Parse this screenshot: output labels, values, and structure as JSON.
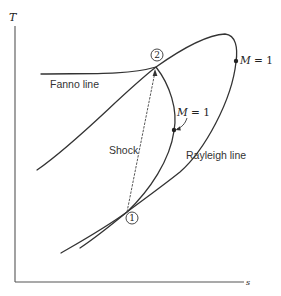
{
  "diagram": {
    "type": "T-s diagram",
    "axes": {
      "y_label": "T",
      "x_label": "s"
    },
    "curves": [
      {
        "name": "Fanno line",
        "label": "Fanno line"
      },
      {
        "name": "Rayleigh line",
        "label": "Rayleigh line"
      }
    ],
    "shock": {
      "label": "Shock",
      "style": "dashed",
      "from_state": "1",
      "to_state": "2"
    },
    "states": [
      {
        "id": "1",
        "label": "1"
      },
      {
        "id": "2",
        "label": "2"
      }
    ],
    "mach_points": [
      {
        "curve": "Rayleigh line",
        "label_M": "M",
        "label_rest": " = 1",
        "text": "M = 1"
      },
      {
        "curve": "Fanno line",
        "label_M": "M",
        "label_rest": " = 1",
        "text": "M = 1"
      }
    ],
    "colors": {
      "line": "#333333",
      "background": "#ffffff"
    }
  }
}
